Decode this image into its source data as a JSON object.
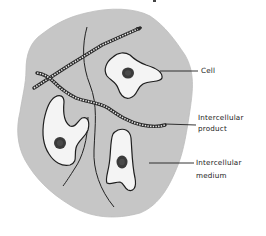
{
  "diagram": {
    "colors": {
      "background": "#ffffff",
      "tissue_fill": "#c6c6c6",
      "cell_fill": "#f4f4f4",
      "outline": "#1e1e1e",
      "nucleus": "#3a3a3a"
    },
    "labels": [
      {
        "id": "cell",
        "text": "Cell"
      },
      {
        "id": "intercellular-product",
        "line1": "Intercellular",
        "line2": "product"
      },
      {
        "id": "intercellular-medium",
        "line1": "Intercellular",
        "line2": "medium"
      }
    ],
    "elements": {
      "tissue_region": "intercellular-medium",
      "cells": 3,
      "fibers": 2,
      "thread_lines": 2
    }
  }
}
